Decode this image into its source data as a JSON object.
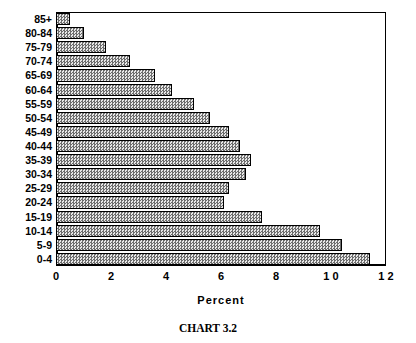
{
  "caption": "CHART 3.2",
  "chart_data": {
    "type": "bar",
    "orientation": "horizontal",
    "title": "",
    "subtitle": "",
    "caption": "CHART 3.2",
    "xlabel": "Percent",
    "ylabel": "",
    "xlim": [
      0,
      12
    ],
    "xticks": [
      0,
      2,
      4,
      6,
      8,
      10,
      12
    ],
    "xtick_labels": [
      "0",
      "2",
      "4",
      "6",
      "8",
      "1 0",
      "1 2"
    ],
    "grid": false,
    "legend": null,
    "bar_style": {
      "fill": "#c9c9c9",
      "pattern": "checkered-gray-dither",
      "border": "#000000"
    },
    "categories": [
      "85+",
      "80-84",
      "75-79",
      "70-74",
      "65-69",
      "60-64",
      "55-59",
      "50-54",
      "45-49",
      "40-44",
      "35-39",
      "30-34",
      "25-29",
      "20-24",
      "15-19",
      "10-14",
      "5-9",
      "0-4"
    ],
    "values": [
      0.5,
      1.0,
      1.8,
      2.7,
      3.6,
      4.2,
      5.0,
      5.6,
      6.3,
      6.7,
      7.1,
      6.9,
      6.3,
      6.1,
      7.5,
      9.6,
      10.4,
      11.4
    ]
  }
}
